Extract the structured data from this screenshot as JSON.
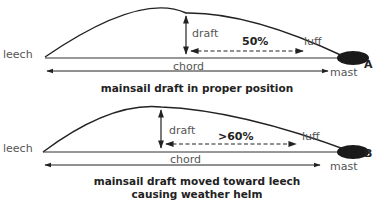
{
  "diagram": {
    "panels": [
      {
        "id": "A",
        "tag": "A",
        "labels": {
          "leech": "leech",
          "luff": "luff",
          "draft": "draft",
          "chord": "chord",
          "mast": "mast",
          "percent": "50%"
        },
        "caption_lines": [
          "mainsail draft in proper position"
        ]
      },
      {
        "id": "B",
        "tag": "B",
        "labels": {
          "leech": "leech",
          "luff": "luff",
          "draft": "draft",
          "chord": "chord",
          "mast": "mast",
          "percent": ">60%"
        },
        "caption_lines": [
          "mainsail draft moved toward leech",
          "causing weather helm"
        ]
      }
    ],
    "colors": {
      "line": "#222222",
      "label": "#555555",
      "mast": "#1a1a1a"
    }
  }
}
